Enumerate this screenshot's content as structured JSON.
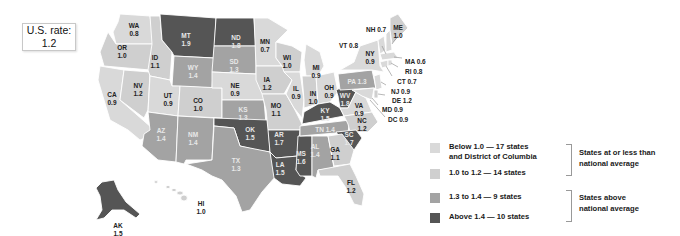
{
  "us_rate": {
    "label": "U.S. rate:",
    "value": "1.2"
  },
  "colors": {
    "below_1_0": "#d9d9d9",
    "1_0_to_1_2": "#cfcfcf",
    "1_3_to_1_4": "#a3a3a3",
    "above_1_4": "#555555",
    "state_border": "#ffffff",
    "bracket": "#999999"
  },
  "legend": {
    "items": [
      {
        "line1": "Below 1.0 — 17 states",
        "line2": "and District of Columbia",
        "color_key": "below_1_0"
      },
      {
        "line1": "1.0 to 1.2 — 14 states",
        "line2": "",
        "color_key": "1_0_to_1_2"
      },
      {
        "line1": "1.3 to 1.4 — 9 states",
        "line2": "",
        "color_key": "1_3_to_1_4"
      },
      {
        "line1": "Above 1.4 — 10 states",
        "line2": "",
        "color_key": "above_1_4"
      }
    ],
    "groups": [
      {
        "line1": "States at or less than",
        "line2": "national average"
      },
      {
        "line1": "States above",
        "line2": "national average"
      }
    ]
  },
  "states": [
    {
      "abbr": "WA",
      "value": "0.8"
    },
    {
      "abbr": "OR",
      "value": "1.0"
    },
    {
      "abbr": "CA",
      "value": "0.9"
    },
    {
      "abbr": "ID",
      "value": "1.1"
    },
    {
      "abbr": "NV",
      "value": "1.2"
    },
    {
      "abbr": "MT",
      "value": "1.9"
    },
    {
      "abbr": "WY",
      "value": "1.4"
    },
    {
      "abbr": "UT",
      "value": "0.9"
    },
    {
      "abbr": "CO",
      "value": "1.0"
    },
    {
      "abbr": "AZ",
      "value": "1.4"
    },
    {
      "abbr": "NM",
      "value": "1.4"
    },
    {
      "abbr": "ND",
      "value": "1.8"
    },
    {
      "abbr": "SD",
      "value": "1.3"
    },
    {
      "abbr": "NE",
      "value": "0.9"
    },
    {
      "abbr": "KS",
      "value": "1.3"
    },
    {
      "abbr": "OK",
      "value": "1.5"
    },
    {
      "abbr": "TX",
      "value": "1.3"
    },
    {
      "abbr": "MN",
      "value": "0.7"
    },
    {
      "abbr": "IA",
      "value": "1.2"
    },
    {
      "abbr": "MO",
      "value": "1.1"
    },
    {
      "abbr": "AR",
      "value": "1.7"
    },
    {
      "abbr": "LA",
      "value": "1.5"
    },
    {
      "abbr": "WI",
      "value": "1.0"
    },
    {
      "abbr": "IL",
      "value": "0.9"
    },
    {
      "abbr": "MI",
      "value": "0.9"
    },
    {
      "abbr": "IN",
      "value": "1.0"
    },
    {
      "abbr": "OH",
      "value": "0.9"
    },
    {
      "abbr": "KY",
      "value": "1.5"
    },
    {
      "abbr": "TN",
      "value": "1.4"
    },
    {
      "abbr": "MS",
      "value": "1.6"
    },
    {
      "abbr": "AL",
      "value": "1.4"
    },
    {
      "abbr": "GA",
      "value": "1.1"
    },
    {
      "abbr": "FL",
      "value": "1.2"
    },
    {
      "abbr": "SC",
      "value": "1.7"
    },
    {
      "abbr": "NC",
      "value": "1.2"
    },
    {
      "abbr": "VA",
      "value": "0.9"
    },
    {
      "abbr": "WV",
      "value": "1.8"
    },
    {
      "abbr": "PA",
      "value": "1.3"
    },
    {
      "abbr": "NY",
      "value": "0.9"
    },
    {
      "abbr": "VT",
      "value": "0.8"
    },
    {
      "abbr": "NH",
      "value": "0.7"
    },
    {
      "abbr": "ME",
      "value": "1.0"
    },
    {
      "abbr": "MA",
      "value": "0.6"
    },
    {
      "abbr": "RI",
      "value": "0.8"
    },
    {
      "abbr": "CT",
      "value": "0.7"
    },
    {
      "abbr": "NJ",
      "value": "0.9"
    },
    {
      "abbr": "DE",
      "value": "1.2"
    },
    {
      "abbr": "MD",
      "value": "0.9"
    },
    {
      "abbr": "DC",
      "value": "0.9"
    },
    {
      "abbr": "AK",
      "value": "1.5"
    },
    {
      "abbr": "HI",
      "value": "1.0"
    }
  ],
  "outside_labels": {
    "NH": "NH 0.7",
    "VT": "VT 0.8",
    "MA": "MA 0.6",
    "RI": "RI 0.8",
    "CT": "CT 0.7",
    "NJ": "NJ 0.9",
    "DE": "DE 1.2",
    "MD": "MD 0.9",
    "DC": "DC 0.9",
    "PA": "PA 1.3",
    "TN": "TN 1.4"
  }
}
